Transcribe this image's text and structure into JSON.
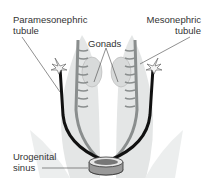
{
  "labels": {
    "paramesonephric_line1": "Paramesonephric",
    "paramesonephric_line2": "tubule",
    "mesonephric_line1": "Mesonephric",
    "mesonephric_line2": "tubule",
    "gonads": "Gonads",
    "urogenital_line1": "Urogenital",
    "urogenital_line2": "sinus"
  }
}
